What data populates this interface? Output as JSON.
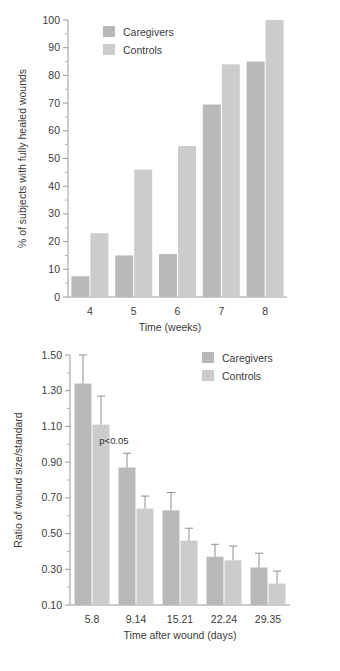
{
  "colors": {
    "caregivers": "#b9b9b9",
    "controls": "#cccccc",
    "axis": "#9a9a9a",
    "text": "#3b3b3b",
    "background": "#ffffff"
  },
  "legend": {
    "caregivers_label": "Caregivers",
    "controls_label": "Controls"
  },
  "chart_data": [
    {
      "id": "healed-wounds-chart",
      "type": "bar",
      "title": "",
      "xlabel": "Time (weeks)",
      "ylabel": "% of subjects with fully healed wounds",
      "categories": [
        "4",
        "5",
        "6",
        "7",
        "8"
      ],
      "ylim": [
        0,
        100
      ],
      "yticks": [
        0,
        10,
        20,
        30,
        40,
        50,
        60,
        70,
        80,
        90,
        100
      ],
      "ytick_labels": [
        "0",
        "10",
        "20",
        "30",
        "40",
        "50",
        "60",
        "70",
        "80",
        "90",
        "100"
      ],
      "grid": false,
      "legend_position": "top-left",
      "series": [
        {
          "name": "Caregivers",
          "values": [
            7.5,
            15.0,
            15.5,
            69.5,
            85.0
          ]
        },
        {
          "name": "Controls",
          "values": [
            23.0,
            46.0,
            54.5,
            84.0,
            100.0
          ]
        }
      ]
    },
    {
      "id": "wound-size-ratio-chart",
      "type": "bar",
      "title": "",
      "xlabel": "Time after wound (days)",
      "ylabel": "Ratio of wound size/standard",
      "categories": [
        "5.8",
        "9.14",
        "15.21",
        "22.24",
        "29.35"
      ],
      "ylim": [
        0.1,
        1.5
      ],
      "yticks": [
        0.1,
        0.3,
        0.5,
        0.7,
        0.9,
        1.1,
        1.3,
        1.5
      ],
      "ytick_labels": [
        "0.10",
        "0.30",
        "0.50",
        "0.70",
        "0.90",
        "1.10",
        "1.30",
        "1.50"
      ],
      "grid": false,
      "legend_position": "top-right",
      "annotations": [
        {
          "text": "p<0.05",
          "x_category": "9.14",
          "y_value": 1.0
        }
      ],
      "series": [
        {
          "name": "Caregivers",
          "values": [
            1.34,
            0.87,
            0.63,
            0.37,
            0.31
          ],
          "errors_upper": [
            1.5,
            0.95,
            0.73,
            0.44,
            0.39
          ],
          "errors_lower": [
            1.18,
            0.79,
            0.53,
            0.3,
            0.23
          ]
        },
        {
          "name": "Controls",
          "values": [
            1.11,
            0.64,
            0.46,
            0.35,
            0.22
          ],
          "errors_upper": [
            1.27,
            0.71,
            0.53,
            0.43,
            0.29
          ],
          "errors_lower": [
            0.95,
            0.57,
            0.39,
            0.27,
            0.15
          ]
        }
      ]
    }
  ]
}
